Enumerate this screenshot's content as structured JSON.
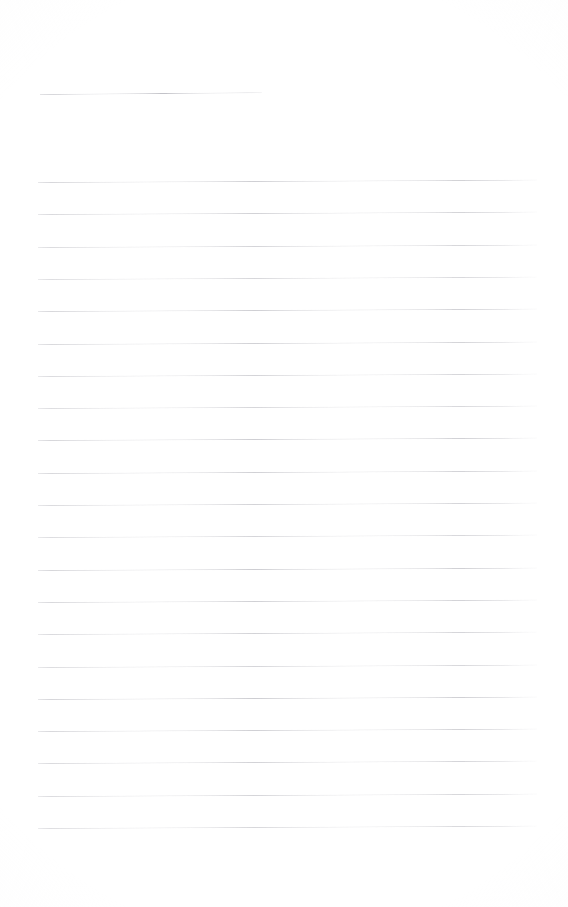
{
  "page": {
    "width_px": 568,
    "height_px": 907,
    "background_color": "#ffffff",
    "rule_color": "#c9c9ce",
    "content_text": ""
  },
  "rules": {
    "header_rule": {
      "name": "header-rule",
      "x_px": 40,
      "y_px": 94,
      "width_px": 222,
      "skew_deg": -0.45,
      "color": "#c2c2c8"
    },
    "body_rule_count": 21,
    "body_first_y_px": 182,
    "body_spacing_px": 32.3,
    "body_x_px": 38,
    "body_width_px": 499,
    "body_skew_deg": -0.28,
    "body_lines": [
      {
        "index": 1,
        "y_px": 182.0,
        "text": ""
      },
      {
        "index": 2,
        "y_px": 214.3,
        "text": ""
      },
      {
        "index": 3,
        "y_px": 246.6,
        "text": ""
      },
      {
        "index": 4,
        "y_px": 278.9,
        "text": ""
      },
      {
        "index": 5,
        "y_px": 311.2,
        "text": ""
      },
      {
        "index": 6,
        "y_px": 343.5,
        "text": ""
      },
      {
        "index": 7,
        "y_px": 375.8,
        "text": ""
      },
      {
        "index": 8,
        "y_px": 408.1,
        "text": ""
      },
      {
        "index": 9,
        "y_px": 440.4,
        "text": ""
      },
      {
        "index": 10,
        "y_px": 472.7,
        "text": ""
      },
      {
        "index": 11,
        "y_px": 505.0,
        "text": ""
      },
      {
        "index": 12,
        "y_px": 537.3,
        "text": ""
      },
      {
        "index": 13,
        "y_px": 569.6,
        "text": ""
      },
      {
        "index": 14,
        "y_px": 601.9,
        "text": ""
      },
      {
        "index": 15,
        "y_px": 634.2,
        "text": ""
      },
      {
        "index": 16,
        "y_px": 666.5,
        "text": ""
      },
      {
        "index": 17,
        "y_px": 698.8,
        "text": ""
      },
      {
        "index": 18,
        "y_px": 731.1,
        "text": ""
      },
      {
        "index": 19,
        "y_px": 763.4,
        "text": ""
      },
      {
        "index": 20,
        "y_px": 795.7,
        "text": ""
      },
      {
        "index": 21,
        "y_px": 828.0,
        "text": ""
      }
    ]
  }
}
